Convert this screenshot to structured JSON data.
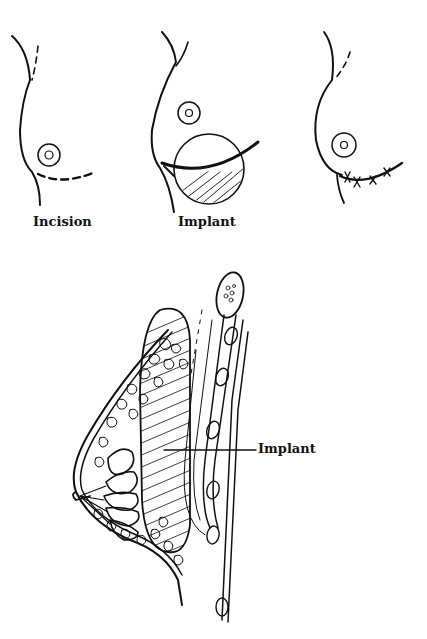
{
  "figure": {
    "top_row": {
      "panels": [
        {
          "id": "incision",
          "label": "Incision"
        },
        {
          "id": "implant",
          "label": "Implant"
        },
        {
          "id": "sutured",
          "label": ""
        }
      ]
    },
    "cross_section": {
      "callout_label": "Implant"
    },
    "colors": {
      "ink": "#111111",
      "background": "#ffffff"
    }
  }
}
